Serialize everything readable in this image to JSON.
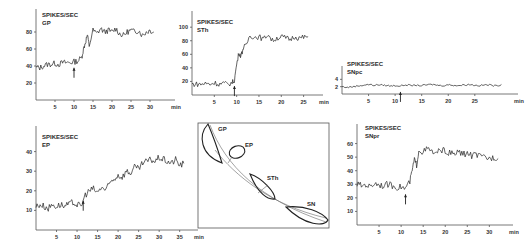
{
  "figure": {
    "units_label": "SPIKES/SEC",
    "time_unit": "min",
    "stimulus_marker": "arrow"
  },
  "chart_data": [
    {
      "id": "gp",
      "type": "line",
      "panel_label": "GP",
      "ylabel": "SPIKES/SEC",
      "xlabel": "min",
      "yticks": [
        20,
        40,
        60,
        80
      ],
      "xticks": [
        5,
        10,
        15,
        20,
        25,
        30
      ],
      "xlim": [
        0,
        35
      ],
      "ylim": [
        0,
        100
      ],
      "arrow_at": 10,
      "x": [
        0,
        1,
        2,
        3,
        4,
        5,
        6,
        7,
        8,
        9,
        10,
        11,
        12,
        12.5,
        13,
        13.5,
        14,
        15,
        16,
        17,
        18,
        19,
        20,
        21,
        22,
        23,
        24,
        25,
        26,
        27,
        28,
        29,
        30,
        31
      ],
      "y": [
        38,
        38,
        40,
        42,
        42,
        43,
        42,
        44,
        44,
        44,
        45,
        46,
        50,
        60,
        68,
        76,
        64,
        82,
        78,
        84,
        80,
        82,
        80,
        84,
        78,
        76,
        80,
        82,
        80,
        82,
        76,
        80,
        82,
        80
      ]
    },
    {
      "id": "sth",
      "type": "line",
      "panel_label": "STh",
      "ylabel": "SPIKES/SEC",
      "xlabel": "min",
      "yticks": [
        20,
        40,
        60,
        80,
        100
      ],
      "xticks": [
        5,
        10,
        15,
        20,
        25
      ],
      "xlim": [
        0,
        28
      ],
      "ylim": [
        0,
        115
      ],
      "arrow_at": 9.5,
      "x": [
        0,
        1,
        2,
        3,
        4,
        5,
        6,
        7,
        8,
        9,
        9.5,
        10,
        10.5,
        11,
        11.5,
        12,
        13,
        14,
        15,
        16,
        17,
        18,
        19,
        20,
        21,
        22,
        23,
        24,
        25,
        26
      ],
      "y": [
        16,
        16,
        16,
        17,
        16,
        18,
        16,
        17,
        16,
        18,
        22,
        45,
        62,
        58,
        70,
        72,
        88,
        85,
        86,
        82,
        90,
        80,
        84,
        86,
        84,
        82,
        86,
        84,
        85,
        86
      ]
    },
    {
      "id": "sn_upper",
      "type": "line",
      "panel_label": "SNpc",
      "ylabel": "SPIKES/SEC",
      "xlabel": "min",
      "yticks": [
        2,
        4
      ],
      "xticks": [
        5,
        10,
        15,
        20,
        25
      ],
      "xlim": [
        0,
        32
      ],
      "ylim": [
        0,
        6
      ],
      "arrow_at": 11,
      "x": [
        0,
        1,
        2,
        3,
        4,
        5,
        6,
        7,
        8,
        9,
        10,
        11,
        12,
        13,
        14,
        15,
        16,
        17,
        18,
        19,
        20,
        21,
        22,
        23,
        24,
        25,
        26,
        27,
        28,
        29,
        30
      ],
      "y": [
        2,
        1.8,
        2,
        2.2,
        2.4,
        2.6,
        2.4,
        2.5,
        2.4,
        2.2,
        2.3,
        2.2,
        2.5,
        2.3,
        2.4,
        2.3,
        2.5,
        2.6,
        2.4,
        2.3,
        2.5,
        2.4,
        2.3,
        2.5,
        2.6,
        2.4,
        2.3,
        2.5,
        2.4,
        2.2,
        2.6
      ]
    },
    {
      "id": "ep",
      "type": "line",
      "panel_label": "EP",
      "ylabel": "SPIKES/SEC",
      "xlabel": "min",
      "yticks": [
        10,
        20,
        30,
        40
      ],
      "xticks": [
        5,
        10,
        15,
        20,
        25,
        30,
        35
      ],
      "xlim": [
        0,
        38
      ],
      "ylim": [
        0,
        50
      ],
      "arrow_at": 11.5,
      "x": [
        0,
        1,
        2,
        3,
        4,
        5,
        6,
        7,
        8,
        9,
        10,
        11,
        12,
        13,
        14,
        15,
        16,
        17,
        18,
        19,
        20,
        21,
        22,
        23,
        24,
        25,
        26,
        27,
        28,
        29,
        30,
        31,
        32,
        33,
        34,
        35,
        36
      ],
      "y": [
        12,
        13,
        12,
        11,
        13,
        12,
        13,
        12,
        13,
        14,
        13,
        12,
        18,
        20,
        21,
        19,
        22,
        20,
        24,
        26,
        28,
        27,
        30,
        29,
        32,
        31,
        34,
        35,
        36,
        35,
        37,
        36,
        35,
        34,
        36,
        33,
        34
      ]
    },
    {
      "id": "sn_lower",
      "type": "line",
      "panel_label": "SNpr",
      "ylabel": "SPIKES/SEC",
      "xlabel": "min",
      "yticks": [
        10,
        20,
        30,
        40,
        50,
        60
      ],
      "xticks": [
        5,
        10,
        15,
        20,
        25,
        30
      ],
      "xlim": [
        0,
        34
      ],
      "ylim": [
        0,
        70
      ],
      "arrow_at": 11,
      "x": [
        0,
        1,
        2,
        3,
        4,
        5,
        6,
        7,
        8,
        9,
        10,
        11,
        12,
        12.5,
        13,
        13.5,
        14,
        15,
        16,
        17,
        18,
        19,
        20,
        21,
        22,
        23,
        24,
        25,
        26,
        27,
        28,
        29,
        30,
        31,
        32
      ],
      "y": [
        30,
        29,
        30,
        28,
        31,
        30,
        29,
        30,
        29,
        28,
        28,
        27,
        32,
        40,
        48,
        44,
        55,
        54,
        56,
        54,
        52,
        56,
        54,
        53,
        52,
        54,
        52,
        53,
        51,
        52,
        50,
        50,
        49,
        50,
        49
      ]
    }
  ],
  "diagram": {
    "labels": [
      "GP",
      "EP",
      "STh",
      "SN"
    ]
  }
}
